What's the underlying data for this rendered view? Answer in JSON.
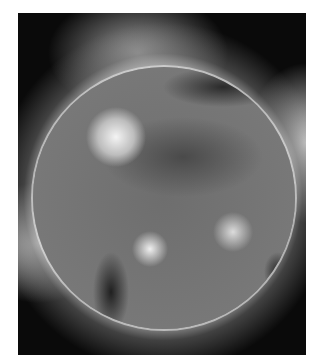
{
  "image": {
    "description": "Grayscale extreme-ultraviolet image of the Sun showing the solar disk with bright active regions, dark coronal holes, and a glowing corona against a black background",
    "colors": {
      "background": "#0a0a0a",
      "corona": "#e6e6e6",
      "disk": "#757575",
      "page": "#ffffff"
    }
  }
}
